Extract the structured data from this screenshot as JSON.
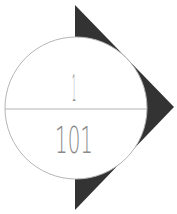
{
  "diagram": {
    "type": "logo",
    "numerator": "1",
    "denominator": "101",
    "colors": {
      "background": "#ffffff",
      "triangle": "#333333",
      "circle_fill": "#ffffff",
      "circle_stroke": "#b5b5b5",
      "divider": "#b5b5b5",
      "text": "#8a8a8a"
    },
    "shapes": [
      {
        "name": "triangle",
        "points": [
          [
            75,
            5
          ],
          [
            174,
            107
          ],
          [
            75,
            210
          ]
        ]
      },
      {
        "name": "circle",
        "cx": 76,
        "cy": 108,
        "r": 71
      },
      {
        "name": "divider",
        "x1": 5,
        "y1": 109,
        "x2": 147,
        "y2": 109
      }
    ]
  }
}
